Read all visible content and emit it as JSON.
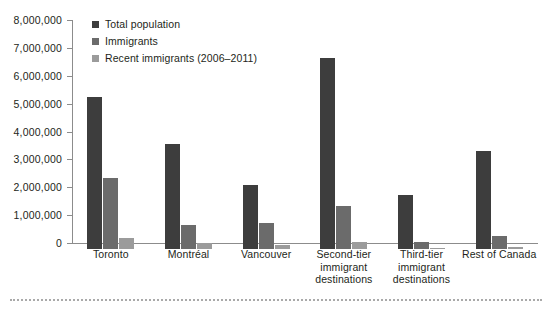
{
  "chart_data": {
    "type": "bar",
    "title": "",
    "xlabel": "",
    "ylabel": "",
    "ylim": [
      0,
      8000000
    ],
    "ytick_step": 1000000,
    "grid": false,
    "legend_position": "top-left",
    "categories": [
      "Toronto",
      "Montréal",
      "Vancouver",
      "Second-tier immigrant destinations",
      "Third-tier immigrant destinations",
      "Rest of Canada"
    ],
    "category_lines": [
      [
        "Toronto"
      ],
      [
        "Montréal"
      ],
      [
        "Vancouver"
      ],
      [
        "Second-tier",
        "immigrant",
        "destinations"
      ],
      [
        "Third-tier",
        "immigrant",
        "destinations"
      ],
      [
        "Rest of Canada"
      ]
    ],
    "ytick_labels": [
      "0",
      "1,000,000",
      "2,000,000",
      "3,000,000",
      "4,000,000",
      "5,000,000",
      "6,000,000",
      "7,000,000",
      "8,000,000"
    ],
    "ytick_values": [
      0,
      1000000,
      2000000,
      3000000,
      4000000,
      5000000,
      6000000,
      7000000,
      8000000
    ],
    "series": [
      {
        "name": "Total population",
        "color": "#3d3d3d",
        "values": [
          5450000,
          3750000,
          2300000,
          6850000,
          1950000,
          3500000
        ]
      },
      {
        "name": "Immigrants",
        "color": "#6b6b6b",
        "values": [
          2550000,
          850000,
          920000,
          1550000,
          250000,
          450000
        ]
      },
      {
        "name": "Recent immigrants (2006–2011)",
        "color": "#9b9b9b",
        "values": [
          390000,
          200000,
          150000,
          240000,
          50000,
          70000
        ]
      }
    ]
  },
  "legend": {
    "items": [
      {
        "label": "Total population",
        "swatch_class": "s0"
      },
      {
        "label": "Immigrants",
        "swatch_class": "s1"
      },
      {
        "label": "Recent immigrants (2006–2011)",
        "swatch_class": "s2"
      }
    ]
  },
  "colors": {
    "series_total_population": "#3d3d3d",
    "series_immigrants": "#6b6b6b",
    "series_recent_immigrants": "#9b9b9b",
    "axis": "#8c8c8c",
    "text": "#231f20",
    "background": "#ffffff",
    "bottom_rule": "#a9a9a9"
  }
}
